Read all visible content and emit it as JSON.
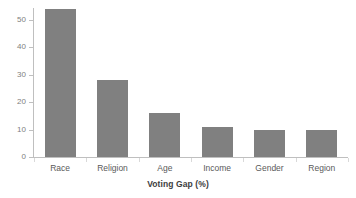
{
  "chart_data": {
    "type": "bar",
    "title": "",
    "subtitle": "",
    "categories": [
      "Race",
      "Religion",
      "Age",
      "Income",
      "Gender",
      "Region"
    ],
    "values": [
      54,
      28,
      16,
      11,
      10,
      10
    ],
    "xlabel": "Voting Gap (%)",
    "ylabel": "",
    "ylim": [
      0,
      55
    ],
    "yticks": [
      0,
      10,
      20,
      30,
      40,
      50
    ],
    "ytick_labels": [
      "0",
      "10",
      "20",
      "30",
      "40",
      "50"
    ],
    "grid": false,
    "legend": null,
    "bar_color": "#808080",
    "axis_color": "#bfbfbf",
    "tick_label_color": "#808080",
    "category_label_color": "#5a5a5a",
    "axis_title_color": "#3d3d3d",
    "background": "#ffffff"
  }
}
